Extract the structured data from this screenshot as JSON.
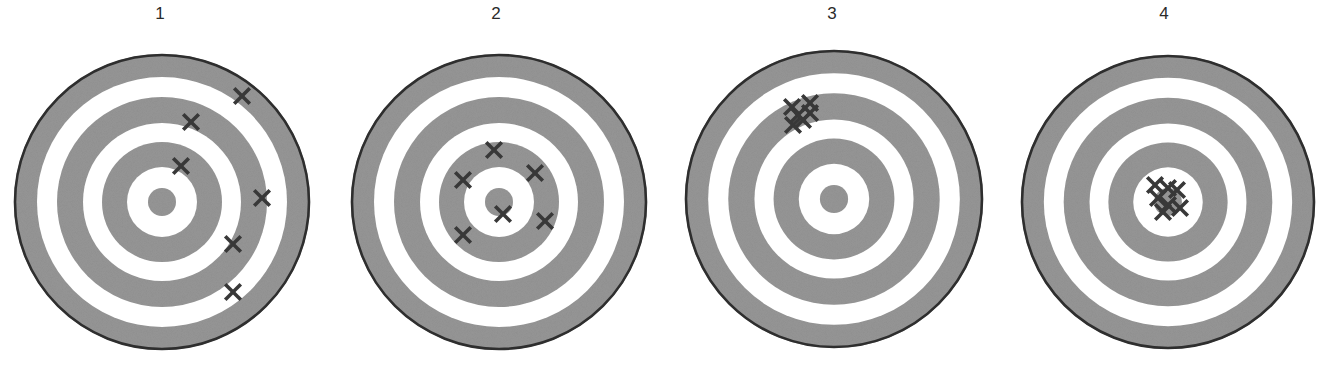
{
  "figure": {
    "colors": {
      "background": "#ffffff",
      "ring_gray": "#8e8e8e",
      "ring_white": "#ffffff",
      "outer_border": "#2e2e2e",
      "marker": "#383838"
    },
    "ring_radii": [
      148,
      125,
      105,
      79,
      60,
      35,
      14
    ],
    "ring_fills": [
      "gray",
      "white",
      "gray",
      "white",
      "gray",
      "white",
      "gray"
    ]
  },
  "targets": [
    {
      "label": "1",
      "center": [
        162,
        202
      ],
      "radius": 148,
      "label_x": 160,
      "hits": [
        [
          242,
          96
        ],
        [
          191,
          122
        ],
        [
          181,
          166
        ],
        [
          262,
          198
        ],
        [
          233,
          244
        ],
        [
          233,
          292
        ]
      ]
    },
    {
      "label": "2",
      "center": [
        499,
        202
      ],
      "radius": 148,
      "label_x": 496,
      "hits": [
        [
          494,
          150
        ],
        [
          463,
          180
        ],
        [
          535,
          173
        ],
        [
          503,
          214
        ],
        [
          545,
          221
        ],
        [
          463,
          235
        ]
      ]
    },
    {
      "label": "3",
      "center": [
        834,
        199
      ],
      "radius": 149,
      "label_x": 832,
      "hits": [
        [
          792,
          107
        ],
        [
          810,
          103
        ],
        [
          798,
          115
        ],
        [
          810,
          113
        ],
        [
          793,
          125
        ],
        [
          803,
          120
        ]
      ]
    },
    {
      "label": "4",
      "center": [
        1168,
        202
      ],
      "radius": 147,
      "label_x": 1164,
      "hits": [
        [
          1155,
          185
        ],
        [
          1168,
          188
        ],
        [
          1177,
          190
        ],
        [
          1158,
          198
        ],
        [
          1168,
          205
        ],
        [
          1180,
          208
        ],
        [
          1163,
          212
        ]
      ]
    }
  ]
}
